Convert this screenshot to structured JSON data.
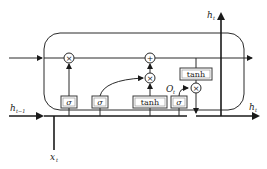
{
  "diagram": {
    "type": "LSTM cell",
    "labels": {
      "h_prev": "h",
      "h_prev_sub": "t−1",
      "x_t": "x",
      "x_t_sub": "t",
      "h_out_top": "h",
      "h_out_top_sub": "t",
      "h_out_right": "h",
      "h_out_right_sub": "t",
      "o_gate": "O",
      "o_gate_sub": "t"
    },
    "gates": [
      {
        "id": "forget-gate",
        "label": "σ"
      },
      {
        "id": "input-gate",
        "label": "σ"
      },
      {
        "id": "candidate",
        "label": "tanh"
      },
      {
        "id": "output-gate",
        "label": "σ"
      }
    ],
    "cell_output_activation": {
      "label": "tanh"
    },
    "operators": [
      {
        "id": "forget-multiply",
        "symbol": "×"
      },
      {
        "id": "cell-add",
        "symbol": "+"
      },
      {
        "id": "input-multiply",
        "symbol": "×"
      },
      {
        "id": "output-multiply",
        "symbol": "×"
      }
    ]
  }
}
